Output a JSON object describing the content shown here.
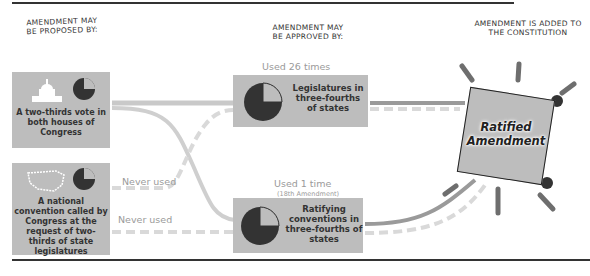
{
  "headers": {
    "proposed": "Amendment may be proposed by:",
    "approved": "Amendment may be approved by:",
    "added": "Amendment is added to the Constitution"
  },
  "proposal_methods": [
    {
      "icon": "capitol-icon",
      "text": "A two-thirds vote in both houses of Congress",
      "pie_fraction": 0.75
    },
    {
      "icon": "us-map-icon",
      "text": "A national convention called by Congress at the request of two-thirds of state legislatures",
      "pie_fraction": 0.75
    }
  ],
  "approval_methods": [
    {
      "usage": "Used 26 times",
      "note": "",
      "text": "Legislatures in three-fourths of states",
      "pie_fraction": 0.75
    },
    {
      "usage": "Used 1 time",
      "note": "(18th Amendment)",
      "text": "Ratifying conventions in three-fourths of states",
      "pie_fraction": 0.75
    }
  ],
  "path_labels": {
    "never_used_1": "Never used",
    "never_used_2": "Never used"
  },
  "result": {
    "text": "Ratified Amendment"
  },
  "colors": {
    "box": "#bdbdbd",
    "pie_dark": "#333333",
    "pie_light": "#bdbdbd",
    "solid_path": "#9a9a9a",
    "dashed_path": "#d9d9d9",
    "ray": "#6e6e6e"
  }
}
